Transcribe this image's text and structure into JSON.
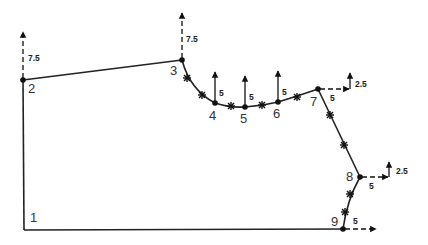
{
  "diagram": {
    "nodes": [
      {
        "id": "1",
        "label": "1",
        "x": 24,
        "y": 230
      },
      {
        "id": "2",
        "label": "2",
        "x": 23,
        "y": 80
      },
      {
        "id": "3",
        "label": "3",
        "x": 182,
        "y": 60
      },
      {
        "id": "4",
        "label": "4",
        "x": 215,
        "y": 103
      },
      {
        "id": "5",
        "label": "5",
        "x": 245,
        "y": 107
      },
      {
        "id": "6",
        "label": "6",
        "x": 278,
        "y": 102
      },
      {
        "id": "7",
        "label": "7",
        "x": 318,
        "y": 89
      },
      {
        "id": "8",
        "label": "8",
        "x": 360,
        "y": 177
      },
      {
        "id": "9",
        "label": "9",
        "x": 343,
        "y": 229
      }
    ],
    "mid_nodes": [
      {
        "x": 187,
        "y": 78
      },
      {
        "x": 202,
        "y": 95
      },
      {
        "x": 231,
        "y": 106
      },
      {
        "x": 262,
        "y": 105
      },
      {
        "x": 297,
        "y": 97
      },
      {
        "x": 330,
        "y": 115
      },
      {
        "x": 344,
        "y": 145
      },
      {
        "x": 350,
        "y": 194
      },
      {
        "x": 345,
        "y": 212
      }
    ],
    "loads": [
      {
        "node": "2",
        "direction": "up",
        "value": "7.5"
      },
      {
        "node": "3",
        "direction": "up",
        "value": "7.5"
      },
      {
        "node": "4",
        "direction": "up",
        "value": "5"
      },
      {
        "node": "5",
        "direction": "up",
        "value": "5"
      },
      {
        "node": "6",
        "direction": "up",
        "value": "5"
      },
      {
        "node": "7",
        "direction": "right",
        "value": "5"
      },
      {
        "node": "7",
        "direction": "up",
        "value": "2.5"
      },
      {
        "node": "8",
        "direction": "right",
        "value": "5"
      },
      {
        "node": "8",
        "direction": "up",
        "value": "2.5"
      },
      {
        "node": "9",
        "direction": "right",
        "value": "5"
      }
    ],
    "labels": {
      "n1": "1",
      "n2": "2",
      "n3": "3",
      "n4": "4",
      "n5": "5",
      "n6": "6",
      "n7": "7",
      "n8": "8",
      "n9": "9",
      "load_2": "7.5",
      "load_3": "7.5",
      "load_4": "5",
      "load_5": "5",
      "load_6": "5",
      "load_7_x": "5",
      "load_7_y": "2.5",
      "load_8_x": "5",
      "load_8_y": "2.5",
      "load_9_x": "5"
    }
  }
}
